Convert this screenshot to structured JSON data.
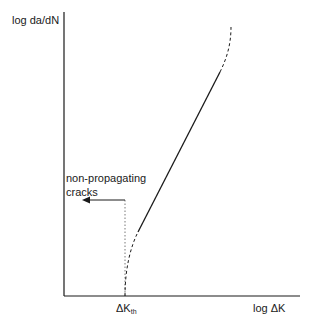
{
  "diagram": {
    "type": "fatigue-crack-growth-schematic",
    "y_axis_label": "log  da/dN",
    "x_axis_label": "log ΔK",
    "threshold_label": {
      "main": "ΔK",
      "sub": "th"
    },
    "annotation": {
      "line1": "non-propagating",
      "line2": "cracks"
    },
    "segments": [
      {
        "name": "near-threshold region",
        "style": "dashed"
      },
      {
        "name": "linear Paris region",
        "style": "solid"
      },
      {
        "name": "rapid growth region",
        "style": "dashed"
      }
    ],
    "colors": {
      "line": "#1a1a1a",
      "background": "#ffffff"
    }
  }
}
